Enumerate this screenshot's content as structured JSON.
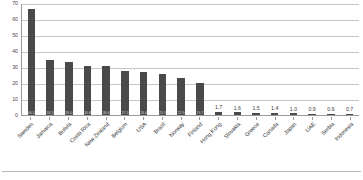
{
  "chart_data": {
    "type": "bar",
    "title": "",
    "subtitle": "",
    "xlabel": "",
    "ylabel": "",
    "ylim": [
      0,
      70
    ],
    "ytick_step": 10,
    "yticks": [
      "0",
      "10",
      "20",
      "30",
      "40",
      "50",
      "60",
      "70"
    ],
    "grid": true,
    "legend": null,
    "bar_color": "#4a4a4a",
    "categories": [
      "Sweden",
      "Jamaica",
      "Bolivia",
      "Costa Rica",
      "New Zealand",
      "Belgium",
      "USA",
      "Brazil",
      "Norway",
      "Finland",
      "Hong Kong",
      "Slovakia",
      "Greece",
      "Canada",
      "Japan",
      "UAE",
      "Serbia",
      "Indonesia"
    ],
    "values": [
      66.5,
      34.3,
      33.0,
      30.8,
      30.6,
      27.3,
      26.6,
      25.9,
      22.9,
      19.7,
      1.7,
      1.6,
      1.5,
      1.4,
      1.0,
      0.9,
      0.9,
      0.7
    ],
    "value_labels": [
      "66.5",
      "34.3",
      "33.0",
      "30.8",
      "30.6",
      "27.3",
      "26.6",
      "25.9",
      "22.9",
      "19.7",
      "1.7",
      "1.6",
      "1.5",
      "1.4",
      "1.0",
      "0.9",
      "0.9",
      "0.7"
    ],
    "label_placement": [
      "inside",
      "inside",
      "inside",
      "inside",
      "inside",
      "inside",
      "inside",
      "inside",
      "inside",
      "inside",
      "outside",
      "outside",
      "outside",
      "outside",
      "outside",
      "outside",
      "outside",
      "outside"
    ]
  },
  "footer": {
    "text": ""
  }
}
